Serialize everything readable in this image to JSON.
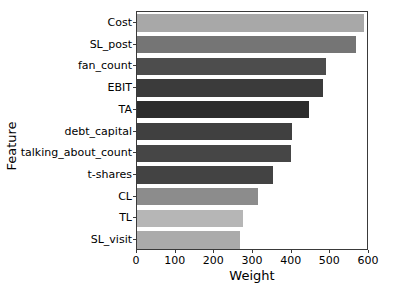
{
  "chart_data": {
    "type": "bar",
    "orientation": "horizontal",
    "title": "",
    "xlabel": "Weight",
    "ylabel": "Feature",
    "xlim": [
      0,
      600
    ],
    "xticks": [
      0,
      100,
      200,
      300,
      400,
      500,
      600
    ],
    "grid": false,
    "legend": null,
    "categories": [
      "Cost",
      "SL_post",
      "fan_count",
      "EBIT",
      "TA",
      "debt_capital",
      "talking_about_count",
      "t-shares",
      "CL",
      "TL",
      "SL_visit"
    ],
    "values": [
      588,
      566,
      489,
      480,
      445,
      401,
      398,
      352,
      312,
      275,
      266
    ],
    "colors": [
      "#a8a8a8",
      "#757575",
      "#4d4d4d",
      "#3b3b3b",
      "#2c2c2c",
      "#404040",
      "#464646",
      "#434343",
      "#8c8c8c",
      "#b6b6b6",
      "#ababab"
    ]
  }
}
